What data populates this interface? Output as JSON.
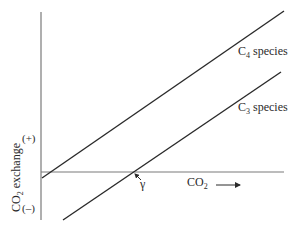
{
  "diagram": {
    "type": "line-diagram",
    "y_axis": {
      "label_main": "CO",
      "label_sub": "2",
      "label_rest": " exchange",
      "positive_marker": "(+)",
      "negative_marker": "(–)"
    },
    "x_axis": {
      "label_main": "CO",
      "label_sub": "2",
      "arrow": "right-arrow"
    },
    "lines": [
      {
        "name": "C4 species",
        "label_main": "C",
        "label_sub": "4",
        "label_rest": " species"
      },
      {
        "name": "C3 species",
        "label_main": "C",
        "label_sub": "3",
        "label_rest": " species"
      }
    ],
    "annotation": {
      "symbol": "γ",
      "meaning": "CO2 compensation point of C3 species"
    },
    "colors": {
      "line": "#2a2a2a",
      "axis": "#7a7a7a",
      "background": "#ffffff"
    }
  }
}
